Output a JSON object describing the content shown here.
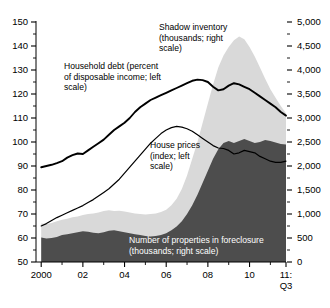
{
  "chart_data": {
    "type": "area",
    "title": "",
    "subtitle": "",
    "xlabel": "",
    "ylabel": "",
    "grid": false,
    "legend_position": "inline-annotations",
    "x_axis": {
      "tick_labels": [
        "2000",
        "02",
        "04",
        "06",
        "08",
        "10",
        "11:"
      ],
      "last_tick_second_line": "Q3",
      "tick_values": [
        2000,
        2002,
        2004,
        2006,
        2008,
        2010,
        2011.75
      ],
      "minor_tick_values": [
        2001,
        2003,
        2005,
        2007,
        2009,
        2011
      ],
      "range": [
        1999.75,
        2011.75
      ]
    },
    "left_axis": {
      "tick_labels": [
        "150",
        "140",
        "130",
        "120",
        "110",
        "100",
        "90",
        "80",
        "70",
        "60",
        "50"
      ],
      "tick_values": [
        150,
        140,
        130,
        120,
        110,
        100,
        90,
        80,
        70,
        60,
        50
      ],
      "minor_tick_values": [
        145,
        135,
        125,
        115,
        105,
        95,
        85,
        75,
        65,
        55
      ],
      "range": [
        50,
        150
      ]
    },
    "right_axis": {
      "tick_labels": [
        "5,000",
        "4,500",
        "4,000",
        "3,500",
        "3,000",
        "2,500",
        "2,000",
        "1,500",
        "1,000",
        "500",
        "0"
      ],
      "tick_values": [
        5000,
        4500,
        4000,
        3500,
        3000,
        2500,
        2000,
        1500,
        1000,
        500,
        0
      ],
      "minor_tick_values": [
        4750,
        4250,
        3750,
        3250,
        2750,
        2250,
        1750,
        1250,
        750,
        250
      ],
      "range": [
        0,
        5000
      ]
    },
    "annotations": [
      {
        "name": "shadow-inventory",
        "text": "Shadow inventory\n(thousands; right\nscale)",
        "color": "#000000"
      },
      {
        "name": "household-debt",
        "text": "Household debt (percent\nof disposable income; left\nscale)",
        "color": "#000000"
      },
      {
        "name": "house-prices",
        "text": "House prices\n(index; left\nscale)",
        "color": "#000000"
      },
      {
        "name": "foreclosure",
        "text": "Number of properties in foreclosure\n(thousands; right scale)",
        "color": "#ffffff"
      }
    ],
    "colors": {
      "shadow_inventory_fill": "#d9d9d9",
      "foreclosure_fill": "#4d4d4d",
      "household_debt_line": "#000000",
      "house_prices_line": "#000000",
      "axis": "#000000",
      "background": "#ffffff"
    },
    "series": [
      {
        "name": "Shadow inventory",
        "units": "thousands",
        "axis": "right",
        "type": "area",
        "x": [
          2000,
          2000.25,
          2000.5,
          2000.75,
          2001,
          2001.25,
          2001.5,
          2001.75,
          2002,
          2002.25,
          2002.5,
          2002.75,
          2003,
          2003.25,
          2003.5,
          2003.75,
          2004,
          2004.25,
          2004.5,
          2004.75,
          2005,
          2005.25,
          2005.5,
          2005.75,
          2006,
          2006.25,
          2006.5,
          2006.75,
          2007,
          2007.25,
          2007.5,
          2007.75,
          2008,
          2008.25,
          2008.5,
          2008.75,
          2009,
          2009.25,
          2009.5,
          2009.75,
          2010,
          2010.25,
          2010.5,
          2010.75,
          2011,
          2011.25,
          2011.5,
          2011.75
        ],
        "values": [
          800,
          790,
          810,
          850,
          880,
          900,
          930,
          950,
          980,
          1000,
          1010,
          1030,
          1060,
          1080,
          1060,
          1070,
          1050,
          1030,
          1010,
          1000,
          990,
          1000,
          1010,
          1040,
          1090,
          1180,
          1320,
          1520,
          1800,
          2150,
          2500,
          2900,
          3300,
          3700,
          4050,
          4300,
          4480,
          4620,
          4700,
          4640,
          4480,
          4280,
          4050,
          3820,
          3600,
          3420,
          3250,
          3100
        ]
      },
      {
        "name": "Number of properties in foreclosure",
        "units": "thousands",
        "axis": "right",
        "type": "area",
        "x": [
          2000,
          2000.25,
          2000.5,
          2000.75,
          2001,
          2001.25,
          2001.5,
          2001.75,
          2002,
          2002.25,
          2002.5,
          2002.75,
          2003,
          2003.25,
          2003.5,
          2003.75,
          2004,
          2004.25,
          2004.5,
          2004.75,
          2005,
          2005.25,
          2005.5,
          2005.75,
          2006,
          2006.25,
          2006.5,
          2006.75,
          2007,
          2007.25,
          2007.5,
          2007.75,
          2008,
          2008.25,
          2008.5,
          2008.75,
          2009,
          2009.25,
          2009.5,
          2009.75,
          2010,
          2010.25,
          2010.5,
          2010.75,
          2011,
          2011.25,
          2011.5,
          2011.75
        ],
        "values": [
          510,
          490,
          500,
          520,
          560,
          580,
          600,
          620,
          640,
          630,
          610,
          600,
          620,
          650,
          660,
          640,
          620,
          600,
          580,
          560,
          540,
          530,
          540,
          560,
          600,
          660,
          740,
          850,
          1000,
          1180,
          1400,
          1650,
          1900,
          2150,
          2350,
          2480,
          2520,
          2480,
          2520,
          2560,
          2520,
          2480,
          2500,
          2540,
          2520,
          2490,
          2460,
          2450
        ]
      },
      {
        "name": "Household debt",
        "units": "percent of disposable income",
        "axis": "left",
        "type": "line",
        "x": [
          2000,
          2000.25,
          2000.5,
          2000.75,
          2001,
          2001.25,
          2001.5,
          2001.75,
          2002,
          2002.25,
          2002.5,
          2002.75,
          2003,
          2003.25,
          2003.5,
          2003.75,
          2004,
          2004.25,
          2004.5,
          2004.75,
          2005,
          2005.25,
          2005.5,
          2005.75,
          2006,
          2006.25,
          2006.5,
          2006.75,
          2007,
          2007.25,
          2007.5,
          2007.75,
          2008,
          2008.25,
          2008.5,
          2008.75,
          2009,
          2009.25,
          2009.5,
          2009.75,
          2010,
          2010.25,
          2010.5,
          2010.75,
          2011,
          2011.25,
          2011.5,
          2011.75
        ],
        "values": [
          89.5,
          90.0,
          90.5,
          91.2,
          92.0,
          93.5,
          94.5,
          95.2,
          95.0,
          96.5,
          98.0,
          99.5,
          101.0,
          103.0,
          105.0,
          106.5,
          108.0,
          110.0,
          112.5,
          114.5,
          116.0,
          117.5,
          118.5,
          119.5,
          120.5,
          121.5,
          122.5,
          123.5,
          124.5,
          125.5,
          126.0,
          125.8,
          125.0,
          123.0,
          121.5,
          122.0,
          123.5,
          124.5,
          124.0,
          123.0,
          122.0,
          120.5,
          119.0,
          117.5,
          116.0,
          114.5,
          112.5,
          111.0
        ]
      },
      {
        "name": "House prices",
        "units": "index",
        "axis": "left",
        "type": "line",
        "x": [
          2000,
          2000.25,
          2000.5,
          2000.75,
          2001,
          2001.25,
          2001.5,
          2001.75,
          2002,
          2002.25,
          2002.5,
          2002.75,
          2003,
          2003.25,
          2003.5,
          2003.75,
          2004,
          2004.25,
          2004.5,
          2004.75,
          2005,
          2005.25,
          2005.5,
          2005.75,
          2006,
          2006.25,
          2006.5,
          2006.75,
          2007,
          2007.25,
          2007.5,
          2007.75,
          2008,
          2008.25,
          2008.5,
          2008.75,
          2009,
          2009.25,
          2009.5,
          2009.75,
          2010,
          2010.25,
          2010.5,
          2010.75,
          2011,
          2011.25,
          2011.5,
          2011.75
        ],
        "values": [
          65.0,
          66.0,
          67.3,
          68.5,
          69.5,
          70.5,
          71.5,
          72.5,
          73.5,
          74.8,
          76.0,
          77.5,
          79.0,
          80.5,
          82.5,
          84.5,
          87.0,
          89.5,
          92.0,
          94.5,
          97.0,
          99.5,
          101.5,
          103.5,
          105.0,
          106.0,
          106.5,
          106.2,
          105.5,
          104.5,
          103.0,
          101.5,
          100.0,
          98.5,
          97.5,
          97.3,
          96.5,
          95.0,
          95.5,
          96.5,
          96.0,
          95.5,
          94.0,
          93.0,
          92.0,
          91.5,
          91.5,
          92.0
        ]
      }
    ]
  },
  "annotations_text": {
    "shadow_inventory": "Shadow inventory\n(thousands; right\nscale)",
    "household_debt": "Household debt (percent\nof disposable income; left\nscale)",
    "house_prices": "House prices\n(index; left\nscale)",
    "foreclosure": "Number of properties in foreclosure\n(thousands; right scale)"
  }
}
